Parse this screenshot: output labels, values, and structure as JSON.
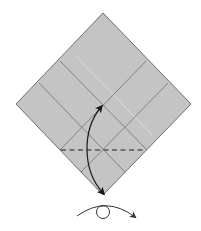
{
  "diagram": {
    "type": "origami-step",
    "paper": {
      "shape": "square-diamond",
      "fill": "#c4c4c4",
      "edge_color": "#6e6e6e",
      "vertices": {
        "top": [
          103,
          13
        ],
        "right": [
          191,
          104
        ],
        "bottom": [
          103,
          195
        ],
        "left": [
          16,
          104
        ]
      }
    },
    "crease_lines": {
      "color": "#7a7a7a",
      "down_right": [
        {
          "from": [
            60,
            61
          ],
          "to": [
            147,
            150
          ]
        },
        {
          "from": [
            39,
            83
          ],
          "to": [
            125,
            172
          ]
        }
      ],
      "down_left": [
        {
          "from": [
            146,
            61
          ],
          "to": [
            60,
            150
          ]
        },
        {
          "from": [
            168,
            83
          ],
          "to": [
            81,
            172
          ]
        }
      ]
    },
    "valley_fold_line": {
      "style": "dashed",
      "color": "#555555",
      "from": [
        61,
        150
      ],
      "to": [
        146,
        150
      ]
    },
    "fold_arrow": {
      "color": "#1a1a1a",
      "from": [
        103,
        193
      ],
      "to": [
        101,
        106
      ],
      "direction": "up"
    },
    "turn_over_symbol": {
      "color": "#333333",
      "circle_center": [
        103,
        212
      ],
      "circle_radius": 6,
      "arc_from": [
        77,
        216
      ],
      "arc_to": [
        135,
        217
      ],
      "meaning": "turn-over"
    }
  }
}
